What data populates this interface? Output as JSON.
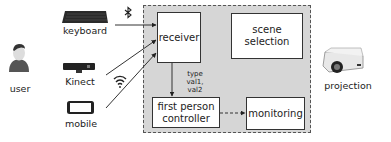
{
  "devices": {
    "user": {
      "label": "user",
      "icon": "user-icon"
    },
    "keyboard": {
      "label": "keyboard",
      "icon": "keyboard-icon"
    },
    "kinect": {
      "label": "Kinect",
      "icon": "kinect-icon"
    },
    "mobile": {
      "label": "mobile",
      "icon": "mobile-phone-icon"
    },
    "projection": {
      "label": "projection",
      "icon": "projector-icon"
    }
  },
  "connections": {
    "bluetooth_icon": "bluetooth-icon",
    "wifi_icon": "wifi-icon"
  },
  "system": {
    "receiver": "receiver",
    "scene_selection_line1": "scene",
    "scene_selection_line2": "selection",
    "controller_line1": "first person",
    "controller_line2": "controller",
    "monitoring": "monitoring",
    "message_line1": "type",
    "message_line2": "val1, val2"
  },
  "colors": {
    "container_bg": "#d6d6d6",
    "box_bg": "#ffffff",
    "stroke": "#333333"
  }
}
